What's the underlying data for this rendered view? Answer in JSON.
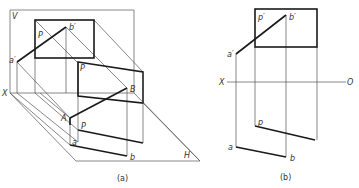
{
  "figure_a": {
    "caption": "(a)",
    "labels": {
      "V": "V",
      "H": "H",
      "X": "X",
      "P_upper": "P",
      "P_mid": "P",
      "P_lower": "P",
      "b_prime": "b′",
      "a_prime": "a′",
      "A": "A",
      "B": "B",
      "a": "a",
      "b": "b"
    }
  },
  "figure_b": {
    "caption": "(b)",
    "labels": {
      "X": "X",
      "O": "O",
      "p_prime": "p′",
      "b_prime": "b′",
      "a_prime": "a′",
      "p": "p",
      "a": "a",
      "b": "b"
    }
  },
  "colors": {
    "thick_line": "#1a1a1a",
    "thin_line": "#555555",
    "background": "#ffffff"
  }
}
